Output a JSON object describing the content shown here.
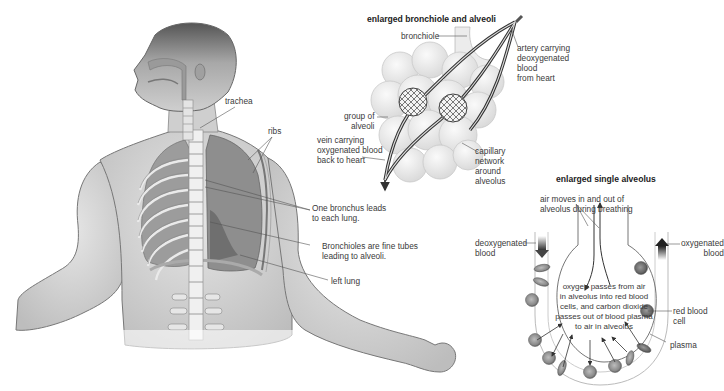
{
  "figure": {
    "topic": "Human respiratory system",
    "body_labels": {
      "trachea": "trachea",
      "ribs": "ribs",
      "bronchus": [
        "One bronchus leads",
        "to each lung."
      ],
      "bronchioles": [
        "Bronchioles are fine tubes",
        "leading to alveoli."
      ],
      "left_lung": "left lung"
    },
    "bronchiole_panel": {
      "title": "enlarged  bronchiole and alveoli",
      "bronchiole": "bronchiole",
      "artery": [
        "artery carrying",
        "deoxygenated",
        "blood",
        "from heart"
      ],
      "group_of_alveoli": [
        "group of",
        "alveoli"
      ],
      "vein": [
        "vein carrying",
        "oxygenated blood",
        "back to heart"
      ],
      "capillary": [
        "capillary",
        "network",
        "around",
        "alveolus"
      ]
    },
    "alveolus_panel": {
      "title": "enlarged single alveolus",
      "air_moves": [
        "air moves in and out of",
        "alveolus during breathing"
      ],
      "deoxygenated": [
        "deoxygenated",
        "blood"
      ],
      "oxygenated": [
        "oxygenated",
        "blood"
      ],
      "exchange": [
        "oxygen passes from air",
        "in alveolus into red blood",
        "cells, and carbon dioxide",
        "passes out of blood plasma",
        "to air in alveolus"
      ],
      "red_blood_cell": [
        "red blood",
        "cell"
      ],
      "plasma": "plasma"
    }
  }
}
